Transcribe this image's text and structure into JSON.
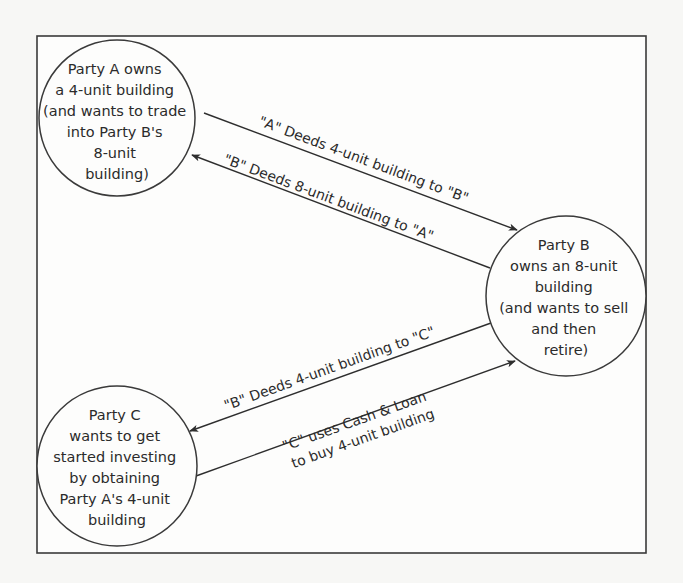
{
  "diagram": {
    "type": "flow",
    "colors": {
      "line": "#2e2e2e",
      "background": "#fdfdfc",
      "text": "#2b2b2b"
    },
    "nodes": [
      {
        "id": "party-a",
        "lines": [
          "Party A owns",
          "a 4-unit building",
          "(and wants to trade",
          "into Party B's",
          "8-unit",
          "building)"
        ]
      },
      {
        "id": "party-b",
        "lines": [
          "Party B",
          "owns an 8-unit",
          "building",
          "(and wants to sell",
          "and then",
          "retire)"
        ]
      },
      {
        "id": "party-c",
        "lines": [
          "Party C",
          "wants to get",
          "started investing",
          "by obtaining",
          "Party A's 4-unit",
          "building"
        ]
      }
    ],
    "edges": [
      {
        "from": "party-a",
        "to": "party-b",
        "lines": [
          "\"A\" Deeds 4-unit building to \"B\""
        ]
      },
      {
        "from": "party-b",
        "to": "party-a",
        "lines": [
          "\"B\" Deeds 8-unit building to \"A\""
        ]
      },
      {
        "from": "party-b",
        "to": "party-c",
        "lines": [
          "\"B\" Deeds 4-unit building to \"C\""
        ]
      },
      {
        "from": "party-c",
        "to": "party-b",
        "lines": [
          "\"C\" uses Cash & Loan",
          "to buy 4-unit building"
        ]
      }
    ]
  }
}
